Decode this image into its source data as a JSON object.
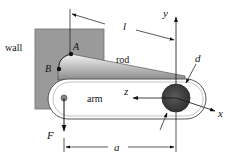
{
  "diagram": {
    "labels": {
      "wall": "wall",
      "rod": "rod",
      "arm": "arm",
      "point_a": "A",
      "point_b": "B",
      "length_l": "l",
      "length_a": "a",
      "diameter_d": "d",
      "force_f": "F",
      "axis_x": "x",
      "axis_y": "y",
      "axis_z": "z"
    },
    "colors": {
      "wall": "#9a9a9a",
      "wall_edge": "#6e6e6e",
      "rod_light": "#f2f2f2",
      "rod_dark": "#8c8c8c",
      "arm_fill": "#ffffff",
      "arm_edge": "#555555",
      "disk": "#4a4a4a",
      "disk_edge": "#2a2a2a",
      "line": "#111111"
    }
  }
}
